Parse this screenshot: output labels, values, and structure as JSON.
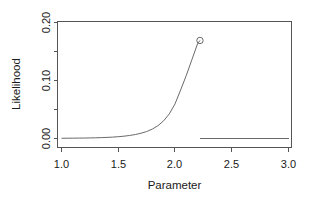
{
  "chart_data": {
    "type": "line",
    "title": "",
    "xlabel": "Parameter",
    "ylabel": "Likelihood",
    "xlim": [
      0.9,
      3.05
    ],
    "ylim": [
      -0.008,
      0.208
    ],
    "grid": false,
    "legend": null,
    "x_ticks": [
      1.0,
      1.5,
      2.0,
      2.5,
      3.0
    ],
    "x_tick_labels": [
      "1.0",
      "1.5",
      "2.0",
      "2.5",
      "3.0"
    ],
    "y_ticks": [
      0.0,
      0.05,
      0.1,
      0.15,
      0.2
    ],
    "y_tick_labels": [
      "0.00",
      "",
      "0.10",
      "",
      "0.20"
    ],
    "y_labeled_ticks": [
      0.0,
      0.1,
      0.2
    ],
    "series": [
      {
        "name": "likelihood-curve",
        "style": "line",
        "x": [
          1.0,
          1.05,
          1.1,
          1.15,
          1.2,
          1.25,
          1.3,
          1.35,
          1.4,
          1.45,
          1.5,
          1.55,
          1.6,
          1.65,
          1.7,
          1.75,
          1.8,
          1.85,
          1.9,
          1.95,
          2.0,
          2.05,
          2.1,
          2.15,
          2.2,
          2.22
        ],
        "y": [
          0.0004,
          0.0005,
          0.0006,
          0.0007,
          0.0008,
          0.001,
          0.0012,
          0.0015,
          0.0019,
          0.0024,
          0.0031,
          0.004,
          0.0052,
          0.0068,
          0.009,
          0.012,
          0.0162,
          0.0221,
          0.0305,
          0.0425,
          0.0596,
          0.0838,
          0.109,
          0.1365,
          0.164,
          0.169
        ]
      },
      {
        "name": "baseline-segment",
        "style": "line",
        "x": [
          2.22,
          3.0
        ],
        "y": [
          0.0005,
          0.0005
        ]
      },
      {
        "name": "maximum-point",
        "style": "open-circle",
        "x": [
          2.22
        ],
        "y": [
          0.169
        ]
      }
    ],
    "annotations": []
  },
  "figure": {
    "background_color": "#ffffff",
    "axis_color": "#555555",
    "data_color": "#6a6a6a"
  }
}
